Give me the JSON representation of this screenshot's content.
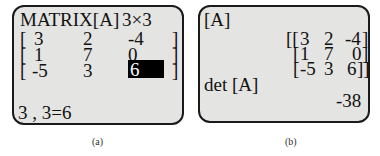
{
  "panel_a": {
    "title": "MATRIX[A]",
    "dims": "3×3",
    "rows": [
      [
        "3",
        "2",
        "-4"
      ],
      [
        "1",
        "7",
        "0"
      ],
      [
        "-5",
        "3",
        "6"
      ]
    ],
    "selected_cell": "6",
    "status": "3 , 3=6",
    "caption": "(a)"
  },
  "panel_b": {
    "label": "[A]",
    "matrix_lines": [
      "[[3  2  -4]",
      "[1  7   0]",
      "[-5  3   6]]"
    ],
    "rows": [
      [
        "3",
        "2",
        "-4"
      ],
      [
        "1",
        "7",
        "0"
      ],
      [
        "-5",
        "3",
        "6"
      ]
    ],
    "command": "det [A]",
    "result": "-38",
    "caption": "(b)"
  }
}
